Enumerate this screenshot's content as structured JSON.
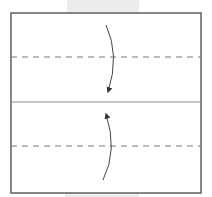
{
  "diagram": {
    "type": "origami-fold-step",
    "colors": {
      "background": "#ffffff",
      "paper_border": "#555555",
      "fold_line": "#777777",
      "arrow": "#444444",
      "shadow_band": "#ececec"
    },
    "paper": {
      "x": 11,
      "y": 13,
      "width": 190,
      "height": 180
    },
    "lines": [
      {
        "name": "top-valley-fold",
        "style": "dashed",
        "y": 57
      },
      {
        "name": "center-crease",
        "style": "solid",
        "y": 102
      },
      {
        "name": "bottom-valley-fold",
        "style": "dashed",
        "y": 146
      }
    ],
    "arrows": [
      {
        "name": "fold-down-arrow",
        "from": [
          106,
          25
        ],
        "to": [
          108,
          93
        ],
        "direction": "down"
      },
      {
        "name": "fold-up-arrow",
        "from": [
          103,
          180
        ],
        "to": [
          105,
          113
        ],
        "direction": "up"
      }
    ]
  }
}
